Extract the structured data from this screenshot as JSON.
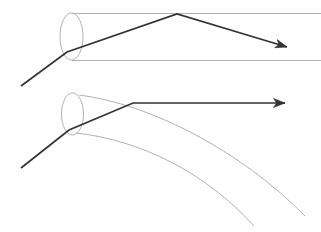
{
  "figure": {
    "title": "",
    "width": 321,
    "height": 232,
    "background_color": "#ffffff",
    "guide_color": "#b2b2b2",
    "ray_color": "#333333",
    "panels": [
      {
        "id": "upper-panel",
        "name": "step-index-fiber-ray-diagram",
        "label": "",
        "waveguide": {
          "type": "cylinder",
          "aperture_ellipse": {
            "cx": 71.5,
            "cy": 36.5,
            "rx": 11.5,
            "ry": 23.5
          },
          "top_wall": {
            "x1": 71.5,
            "y1": 13.0,
            "x2": 321.0,
            "y2": 13.0
          },
          "bottom_wall": {
            "x1": 71.5,
            "y1": 60.0,
            "x2": 321.0,
            "y2": 60.0
          },
          "wall_color": "#b2b2b2",
          "wall_width": 1.0
        },
        "ray": {
          "name": "reflected-ray",
          "color": "#333333",
          "width": 1.7,
          "points": [
            {
              "x": 21,
              "y": 86
            },
            {
              "x": 67,
              "y": 52
            },
            {
              "x": 177,
              "y": 14
            },
            {
              "x": 287,
              "y": 47
            }
          ],
          "arrowhead": {
            "x": 287,
            "y": 47,
            "angle_deg": 17
          }
        }
      },
      {
        "id": "lower-panel",
        "name": "graded-index-fiber-ray-diagram",
        "label": "",
        "waveguide": {
          "type": "cone",
          "aperture_ellipse": {
            "cx": 72.5,
            "cy": 114.0,
            "rx": 11.0,
            "ry": 21.0
          },
          "upper_boundary": {
            "start": {
              "x": 79,
              "y": 95
            },
            "control1": {
              "x": 150,
              "y": 104
            },
            "control2": {
              "x": 240,
              "y": 150
            },
            "end": {
              "x": 305,
              "y": 216
            }
          },
          "lower_boundary": {
            "start": {
              "x": 76,
              "y": 133
            },
            "control1": {
              "x": 140,
              "y": 140
            },
            "control2": {
              "x": 205,
              "y": 172
            },
            "end": {
              "x": 254,
              "y": 226
            }
          },
          "wall_color": "#b2b2b2",
          "wall_width": 1.0
        },
        "ray": {
          "name": "refracted-ray",
          "color": "#333333",
          "width": 1.7,
          "points": [
            {
              "x": 21,
              "y": 168
            },
            {
              "x": 69,
              "y": 130
            },
            {
              "x": 133,
              "y": 103
            },
            {
              "x": 285,
              "y": 103
            }
          ],
          "arrowhead": {
            "x": 285,
            "y": 103,
            "angle_deg": 0
          }
        }
      }
    ]
  }
}
